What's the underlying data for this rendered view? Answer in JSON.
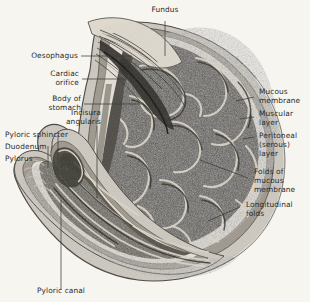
{
  "plate": {
    "title": "Sagittal section of the stomach",
    "background_color": "#f7f5f0",
    "ink_color": "#2b2b2b",
    "width": 310,
    "height": 302
  },
  "labels": {
    "fundus": "Fundus",
    "oesophagus": "Oesophagus",
    "cardiac_orifice_l1": "Cardiac",
    "cardiac_orifice_l2": "orifice",
    "body_of_stomach_l1": "Body of",
    "body_of_stomach_l2": "stomach",
    "incisura_l1": "Incisura",
    "incisura_l2": "angularis",
    "pyloric_sphincter": "Pyloric sphincter",
    "duodenum": "Duodenum",
    "pylorus": "Pylorus",
    "pyloric_canal": "Pyloric canal",
    "mucous_membrane_l1": "Mucous",
    "mucous_membrane_l2": "membrane",
    "muscular_layer_l1": "Muscular",
    "muscular_layer_l2": "layer",
    "peritoneal_l1": "Peritoneal",
    "peritoneal_l2": "(serous)",
    "peritoneal_l3": "layer",
    "folds_mucous_l1": "Folds of",
    "folds_mucous_l2": "mucous",
    "folds_mucous_l3": "membrane",
    "longitudinal_l1": "Longitudinal",
    "longitudinal_l2": "folds"
  },
  "structures": [
    "fundus",
    "oesophagus",
    "cardiac orifice",
    "body of stomach",
    "incisura angularis",
    "pyloric sphincter",
    "duodenum",
    "pylorus",
    "pyloric canal",
    "mucous membrane",
    "muscular layer",
    "peritoneal (serous) layer",
    "folds of mucous membrane",
    "longitudinal folds"
  ]
}
